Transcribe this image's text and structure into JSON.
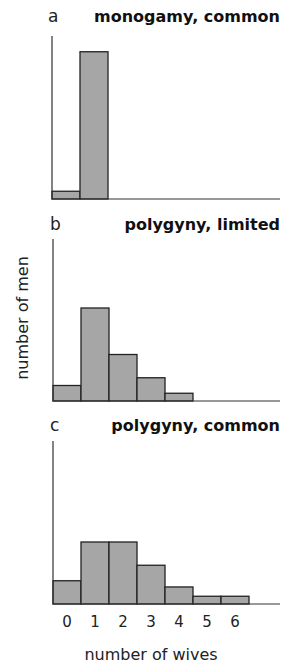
{
  "chart_data": {
    "type": "bar",
    "ylabel": "number of men",
    "xlabel": "number of wives",
    "categories": [
      "0",
      "1",
      "2",
      "3",
      "4",
      "5",
      "6"
    ],
    "grid": false,
    "panels": [
      {
        "letter": "a",
        "title": "monogamy, common",
        "values": [
          0.05,
          0.95,
          0,
          0,
          0,
          0,
          0
        ]
      },
      {
        "letter": "b",
        "title": "polygyny, limited",
        "values": [
          0.1,
          0.6,
          0.3,
          0.15,
          0.05,
          0,
          0
        ]
      },
      {
        "letter": "c",
        "title": "polygyny, common",
        "values": [
          0.15,
          0.4,
          0.4,
          0.25,
          0.11,
          0.05,
          0.05
        ]
      }
    ],
    "colors": {
      "bar_fill": "#a6a6a6",
      "bar_stroke": "#222222"
    }
  }
}
